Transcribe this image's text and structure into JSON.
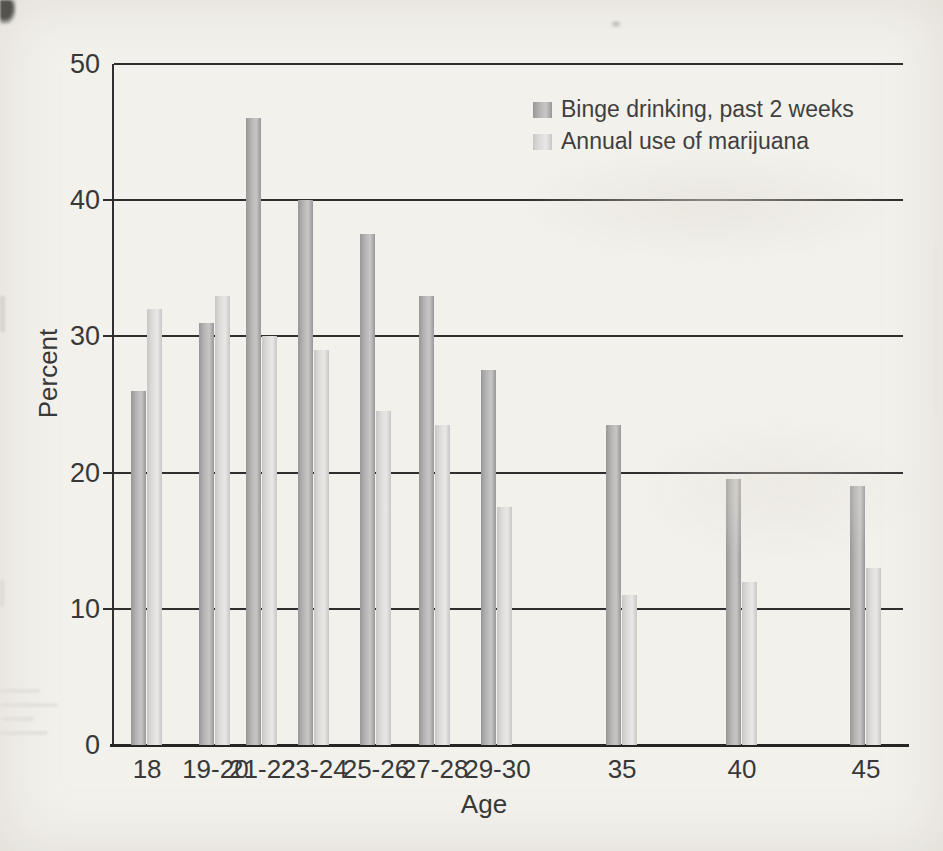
{
  "page": {
    "background": "#f3f1ec",
    "kind": "scanned textbook figure"
  },
  "chart_data": {
    "type": "bar",
    "title": "",
    "xlabel": "Age",
    "ylabel": "Percent",
    "ylim": [
      0,
      50
    ],
    "yticks": [
      0,
      10,
      20,
      30,
      40,
      50
    ],
    "grid": "horizontal",
    "legend_position": "top-center-inside",
    "categories": [
      "18",
      "19-20",
      "21-22",
      "23-24",
      "25-26",
      "27-28",
      "29-30",
      "35",
      "40",
      "45"
    ],
    "x_center_pct": [
      4.2,
      12.85,
      18.8,
      25.4,
      33.2,
      40.7,
      48.6,
      64.4,
      79.6,
      95.3
    ],
    "series": [
      {
        "name": "Binge drinking, past 2 weeks",
        "values": [
          26,
          31,
          46,
          40,
          37.5,
          33,
          27.5,
          23.5,
          19.5,
          19
        ],
        "color_edge": "#97979b",
        "color_main": "#b4b3b1",
        "color_hi": "#c8c7c5"
      },
      {
        "name": "Annual use of marijuana",
        "values": [
          32,
          33,
          30,
          29,
          24.5,
          23.5,
          17.5,
          11,
          12,
          13
        ],
        "color_edge": "#c8c7c5",
        "color_main": "#dcdbd9",
        "color_hi": "#e9e8e6"
      }
    ],
    "axis_color": "#2e2e2e",
    "text_color": "#3c3c3c"
  }
}
